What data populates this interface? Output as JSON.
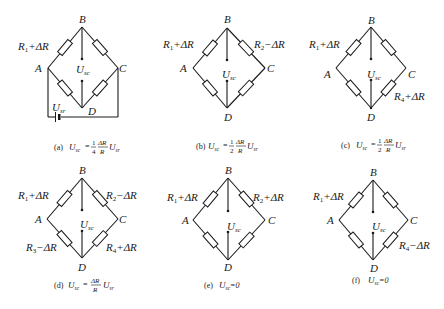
{
  "figure": {
    "node_labels": {
      "top": "B",
      "left": "A",
      "right": "C",
      "bottom": "D"
    },
    "output_label": {
      "main": "U",
      "sub": "sc"
    },
    "supply_label": {
      "main": "U",
      "sub": "sr"
    },
    "panels": [
      {
        "id": "a",
        "arm_AB": "R1+ΔR",
        "arm_BC": "",
        "arm_AD": "",
        "arm_DC": "",
        "has_supply": true,
        "caption": {
          "tag": "(a)",
          "lhs": "U",
          "lhs_sub": "sc",
          "coef_num": "1",
          "coef_den": "4",
          "frac_num": "ΔR",
          "frac_den": "R",
          "rhs": "U",
          "rhs_sub": "sr",
          "text": "(a) Usc = (1/4)(ΔR/R)Usr"
        }
      },
      {
        "id": "b",
        "arm_AB": "R1+ΔR",
        "arm_BC": "R2−ΔR",
        "arm_AD": "",
        "arm_DC": "",
        "has_supply": false,
        "caption": {
          "tag": "(b)",
          "lhs": "U",
          "lhs_sub": "sc",
          "coef_num": "1",
          "coef_den": "2",
          "frac_num": "ΔR",
          "frac_den": "R",
          "rhs": "U",
          "rhs_sub": "sr",
          "text": "(b) Usc = (1/2)(ΔR/R)Usr"
        }
      },
      {
        "id": "c",
        "arm_AB": "R1+ΔR",
        "arm_BC": "",
        "arm_AD": "",
        "arm_DC": "R4+ΔR",
        "has_supply": false,
        "caption": {
          "tag": "(c)",
          "lhs": "U",
          "lhs_sub": "sc",
          "coef_num": "1",
          "coef_den": "2",
          "frac_num": "ΔR",
          "frac_den": "R",
          "rhs": "U",
          "rhs_sub": "sr",
          "text": "(c) Usc = (1/2)(ΔR/R)Usr"
        }
      },
      {
        "id": "d",
        "arm_AB": "R1+ΔR",
        "arm_BC": "R2−ΔR",
        "arm_AD": "R3−ΔR",
        "arm_DC": "R4+ΔR",
        "has_supply": false,
        "caption": {
          "tag": "(d)",
          "lhs": "U",
          "lhs_sub": "sc",
          "frac_num": "ΔR",
          "frac_den": "R",
          "rhs": "U",
          "rhs_sub": "sr",
          "text": "(d) Usc = (ΔR/R)Usr"
        }
      },
      {
        "id": "e",
        "arm_AB": "R1+ΔR",
        "arm_BC": "R2+ΔR",
        "arm_AD": "",
        "arm_DC": "",
        "has_supply": false,
        "caption": {
          "tag": "(e)",
          "lhs": "U",
          "lhs_sub": "sc",
          "rhs_text": "=0",
          "text": "(e) Usc=0"
        }
      },
      {
        "id": "f",
        "arm_AB": "R1+ΔR",
        "arm_BC": "",
        "arm_AD": "",
        "arm_DC": "R4−ΔR",
        "has_supply": false,
        "caption": {
          "tag": "(f)",
          "lhs": "U",
          "lhs_sub": "sc",
          "rhs_text": "=0",
          "text": "(f) Usc=0"
        }
      }
    ],
    "colors": {
      "ink": "#1a1a1a",
      "background": "#ffffff"
    }
  }
}
